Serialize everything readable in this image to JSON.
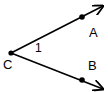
{
  "diagram": {
    "type": "angle",
    "vertex": {
      "label": "C",
      "x": 11,
      "y": 53
    },
    "rays": [
      {
        "name": "ray-CA",
        "point": {
          "label": "A",
          "x": 82,
          "y": 17
        },
        "arrow_tip": {
          "x": 103,
          "y": 6
        }
      },
      {
        "name": "ray-CB",
        "point": {
          "label": "B",
          "x": 82,
          "y": 80
        },
        "arrow_tip": {
          "x": 103,
          "y": 89
        }
      }
    ],
    "angle_label": "1",
    "colors": {
      "stroke": "#000000",
      "background": "#ffffff"
    }
  }
}
